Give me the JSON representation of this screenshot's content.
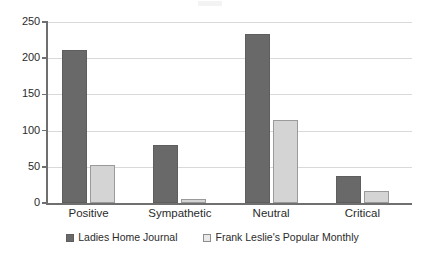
{
  "chart_data": {
    "type": "bar",
    "title": "",
    "subtitle": "",
    "xlabel": "",
    "ylabel": "",
    "categories": [
      "Positive",
      "Sympathetic",
      "Neutral",
      "Critical"
    ],
    "series": [
      {
        "name": "Ladies Home Journal",
        "color": "#696969",
        "values": [
          211,
          80,
          233,
          38
        ]
      },
      {
        "name": "Frank Leslie's Popular Monthly",
        "color": "#d4d4d4",
        "values": [
          52,
          5,
          115,
          17
        ]
      }
    ],
    "ylim": [
      0,
      250
    ],
    "yticks": [
      0,
      50,
      100,
      150,
      200,
      250
    ],
    "ytick_labels": [
      "0",
      "50",
      "100",
      "150",
      "200",
      "250"
    ],
    "grid": true,
    "grid_axis": "y",
    "legend_position": "bottom",
    "annotations": []
  },
  "legend": {
    "items": [
      {
        "label": "Ladies Home Journal",
        "swatch": "legend-swatch-dark"
      },
      {
        "label": "Frank Leslie's Popular Monthly",
        "swatch": "legend-swatch-light"
      }
    ]
  },
  "colors": {
    "series_dark": "#696969",
    "series_light": "#d4d4d4",
    "gridline": "#d9d9d9",
    "axis": "#6f6f6f",
    "text": "#2b2b2b",
    "background": "#ffffff"
  }
}
